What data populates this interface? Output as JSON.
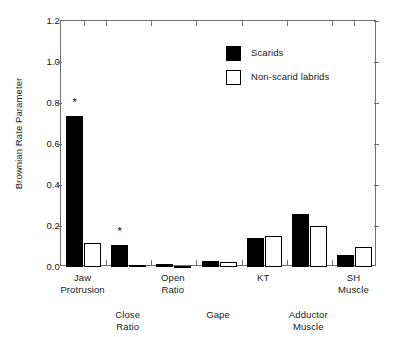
{
  "chart_data": {
    "type": "bar",
    "title": "",
    "subtitle": "",
    "xlabel": "",
    "ylabel": "Brownian Rate Parameter",
    "ylim": [
      0.0,
      1.2
    ],
    "yticks": [
      "0.0",
      "0.2",
      "0.4",
      "0.6",
      "0.8",
      "1.0",
      "1.2"
    ],
    "ytick_values": [
      0.0,
      0.2,
      0.4,
      0.6,
      0.8,
      1.0,
      1.2
    ],
    "grid": false,
    "legend_position": "upper-center-right",
    "categories": [
      "Jaw Protrusion",
      "Close Ratio",
      "Open Ratio",
      "Gape",
      "KT",
      "Adductor Muscle",
      "SH Muscle"
    ],
    "category_lines": [
      [
        "Jaw",
        "Protrusion"
      ],
      [
        "Close",
        "Ratio"
      ],
      [
        "Open",
        "Ratio"
      ],
      [
        "Gape",
        ""
      ],
      [
        "KT",
        ""
      ],
      [
        "Adductor",
        "Muscle"
      ],
      [
        "SH",
        "Muscle"
      ]
    ],
    "series": [
      {
        "name": "Scarids",
        "fill": "#000000",
        "style": "filled",
        "values": [
          0.735,
          0.105,
          0.015,
          0.03,
          0.14,
          0.258,
          0.06
        ]
      },
      {
        "name": "Non-scarid labrids",
        "fill": "#ffffff",
        "style": "open",
        "values": [
          0.115,
          0.01,
          0.006,
          0.025,
          0.15,
          0.198,
          0.098
        ]
      }
    ],
    "annotations": [
      {
        "text": "*",
        "category": "Jaw Protrusion",
        "series": "Scarids",
        "y": 0.8
      },
      {
        "text": "*",
        "category": "Close Ratio",
        "series": "Scarids",
        "y": 0.172
      }
    ]
  },
  "legend": {
    "items": [
      {
        "label": "Scarids",
        "style": "filled"
      },
      {
        "label": "Non-scarid labrids",
        "style": "open"
      }
    ]
  },
  "axis": {
    "y_title": "Brownian Rate Parameter"
  }
}
